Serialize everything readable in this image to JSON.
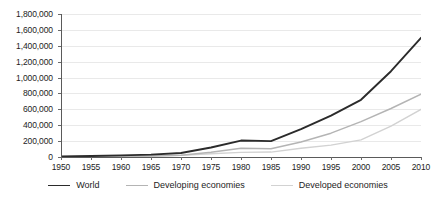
{
  "chart_data": {
    "type": "line",
    "title": "",
    "subtitle": "",
    "xlabel": "",
    "ylabel": "",
    "x": [
      1950,
      1955,
      1960,
      1965,
      1970,
      1975,
      1980,
      1985,
      1990,
      1995,
      2000,
      2005,
      2010
    ],
    "xtick_labels": [
      "1950",
      "1955",
      "1960",
      "1965",
      "1970",
      "1975",
      "1980",
      "1985",
      "1990",
      "1995",
      "2000",
      "2005",
      "2010"
    ],
    "ytick_values": [
      0,
      200000,
      400000,
      600000,
      800000,
      1000000,
      1200000,
      1400000,
      1600000,
      1800000
    ],
    "ytick_labels": [
      "0",
      "200,000",
      "400,000",
      "600,000",
      "800,000",
      "1,000,000",
      "1,200,000",
      "1,400,000",
      "1,600,000",
      "1,800,000"
    ],
    "ylim": [
      0,
      1800000
    ],
    "xlim": [
      1950,
      2010
    ],
    "grid": true,
    "legend_position": "bottom",
    "series": [
      {
        "name": "World",
        "color": "#2b2b2b",
        "width": 1.9,
        "values": [
          8000,
          13000,
          20000,
          30000,
          50000,
          120000,
          207000,
          200000,
          350000,
          520000,
          720000,
          1080000,
          1500000
        ]
      },
      {
        "name": "Developing economies",
        "color": "#b4b4b4",
        "width": 1.5,
        "values": [
          4000,
          6000,
          9000,
          13000,
          22000,
          60000,
          110000,
          105000,
          190000,
          300000,
          445000,
          610000,
          790000
        ]
      },
      {
        "name": "Developed economies",
        "color": "#d2d2d2",
        "width": 1.4,
        "values": [
          3000,
          5000,
          8000,
          12000,
          20000,
          40000,
          58000,
          62000,
          110000,
          150000,
          215000,
          390000,
          600000
        ]
      }
    ]
  },
  "legend": {
    "items": [
      {
        "label": "World",
        "color": "#2b2b2b"
      },
      {
        "label": "Developing economies",
        "color": "#b4b4b4"
      },
      {
        "label": "Developed economies",
        "color": "#d2d2d2"
      }
    ]
  },
  "axes": {
    "y_axis_color": "#5a5a5a",
    "x_axis_color": "#5a5a5a",
    "gridline_color": "#e9e9e9"
  }
}
